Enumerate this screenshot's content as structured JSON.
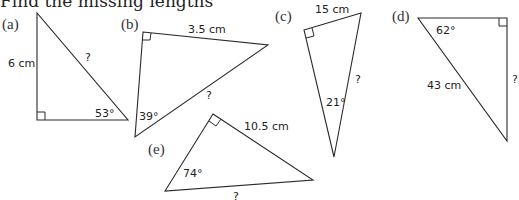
{
  "title": "Find the missing lengths",
  "triangles": [
    {
      "id": "a",
      "part_label": "(a)",
      "labels": {
        "side_known": "6 cm",
        "side_unknown": "?",
        "angle": "53°"
      }
    },
    {
      "id": "b",
      "part_label": "(b)",
      "labels": {
        "side_known": "3.5 cm",
        "side_unknown": "?",
        "angle": "39°"
      }
    },
    {
      "id": "c",
      "part_label": "(c)",
      "labels": {
        "side_known": "15 cm",
        "side_unknown": "?",
        "angle": "21°"
      }
    },
    {
      "id": "d",
      "part_label": "(d)",
      "labels": {
        "side_known": "43 cm",
        "side_unknown": "?",
        "angle": "62°"
      }
    },
    {
      "id": "e",
      "part_label": "(e)",
      "labels": {
        "side_known": "10.5 cm",
        "side_unknown": "?",
        "angle": "74°"
      }
    }
  ]
}
